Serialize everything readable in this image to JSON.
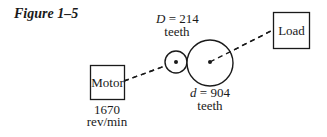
{
  "figure": {
    "label": "Figure 1–5"
  },
  "motor": {
    "label": "Motor",
    "speed_value": "1670",
    "speed_unit": "rev/min"
  },
  "load": {
    "label": "Load"
  },
  "small_gear": {
    "symbol": "D",
    "equals": "= 214",
    "unit": "teeth"
  },
  "large_gear": {
    "symbol": "d",
    "equals": "= 904",
    "unit": "teeth"
  },
  "colors": {
    "stroke": "#1a1a1a",
    "background": "#ffffff"
  }
}
